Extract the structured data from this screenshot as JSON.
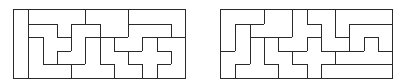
{
  "figures": [
    {
      "id": "left",
      "name": "pentomino-tiling-left",
      "rows": 5,
      "cols": 12,
      "line_color": "#2a2a2a",
      "pieces": {
        "I": "I-pentomino",
        "Y": "Y-pentomino",
        "F": "F-pentomino",
        "V": "V-pentomino",
        "Z": "Z-pentomino",
        "P": "P-pentomino",
        "T": "T-pentomino",
        "W": "W-pentomino",
        "L": "L-pentomino",
        "N": "N-pentomino",
        "X": "X-pentomino",
        "U": "U-pentomino"
      },
      "grid": [
        [
          "I",
          "Y",
          "Y",
          "Y",
          "Y",
          "P",
          "P",
          "P",
          "L",
          "L",
          "L",
          "L"
        ],
        [
          "I",
          "F",
          "F",
          "Y",
          "Z",
          "Z",
          "P",
          "P",
          "N",
          "N",
          "N",
          "L"
        ],
        [
          "I",
          "V",
          "F",
          "F",
          "Z",
          "T",
          "W",
          "N",
          "N",
          "X",
          "U",
          "U"
        ],
        [
          "I",
          "V",
          "F",
          "Z",
          "Z",
          "T",
          "W",
          "W",
          "X",
          "X",
          "X",
          "U"
        ],
        [
          "I",
          "V",
          "V",
          "V",
          "T",
          "T",
          "T",
          "W",
          "W",
          "X",
          "U",
          "U"
        ]
      ]
    },
    {
      "id": "right",
      "name": "pentomino-tiling-right",
      "rows": 5,
      "cols": 12,
      "line_color": "#2a2a2a",
      "pieces": {
        "a": "V-pentomino",
        "b": "N-pentomino",
        "c": "P-pentomino",
        "e": "T-pentomino",
        "f": "W-pentomino",
        "g": "F-pentomino",
        "h": "X-pentomino",
        "i": "Z-pentomino",
        "j": "L-pentomino",
        "k": "U-pentomino",
        "l": "Y-pentomino",
        "m": "I-pentomino"
      },
      "grid": [
        [
          "a",
          "a",
          "a",
          "c",
          "c",
          "g",
          "i",
          "i",
          "j",
          "j",
          "j",
          "j"
        ],
        [
          "a",
          "b",
          "c",
          "c",
          "c",
          "g",
          "g",
          "i",
          "j",
          "k",
          "k",
          "k"
        ],
        [
          "a",
          "b",
          "e",
          "f",
          "g",
          "g",
          "h",
          "i",
          "i",
          "k",
          "l",
          "k"
        ],
        [
          "b",
          "b",
          "e",
          "f",
          "f",
          "h",
          "h",
          "h",
          "l",
          "l",
          "l",
          "l"
        ],
        [
          "b",
          "e",
          "e",
          "e",
          "f",
          "f",
          "h",
          "m",
          "m",
          "m",
          "m",
          "m"
        ]
      ]
    }
  ]
}
